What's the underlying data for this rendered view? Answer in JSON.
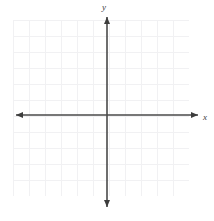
{
  "figure": {
    "type": "coordinate-plane",
    "title": "",
    "background_color": "#ffffff"
  },
  "grid": {
    "visible": true,
    "color": "#f1f1f3",
    "cell_size_px": 16,
    "left_px": 13,
    "top_px": 20,
    "width_px": 176,
    "height_px": 176,
    "columns": 11,
    "rows": 11
  },
  "axes": {
    "color": "#4a4a4a",
    "line_width_px": 1.6,
    "origin": {
      "x_px": 107,
      "y_px": 115
    },
    "x_axis": {
      "label": "x",
      "start_px": 16,
      "end_px": 198,
      "y_px": 115,
      "arrow_start": true,
      "arrow_end": true
    },
    "y_axis": {
      "label": "y",
      "start_px": 17,
      "end_px": 207,
      "x_px": 107,
      "arrow_start": true,
      "arrow_end": true
    }
  },
  "chart_data": {
    "type": "scatter",
    "title": "",
    "xlabel": "x",
    "ylabel": "y",
    "series": [],
    "x": [],
    "values": [],
    "xlim": [
      -6,
      6
    ],
    "ylim": [
      -6,
      6
    ],
    "xticks": [],
    "yticks": [],
    "xticklabels": [],
    "yticklabels": [],
    "grid": true,
    "legend": false,
    "annotations": []
  }
}
